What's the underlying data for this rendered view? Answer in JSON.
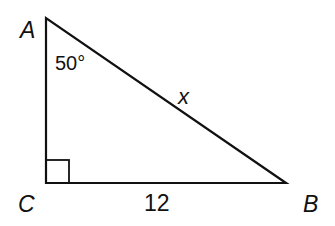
{
  "diagram": {
    "type": "right-triangle",
    "vertices": {
      "A": {
        "label": "A",
        "x": 46,
        "y": 18
      },
      "C": {
        "label": "C",
        "x": 46,
        "y": 183
      },
      "B": {
        "label": "B",
        "x": 286,
        "y": 183
      }
    },
    "angle_label": "50°",
    "angle_at": "A",
    "right_angle_at": "C",
    "hypotenuse_label": "x",
    "base_label": "12",
    "line_color": "#111111"
  }
}
